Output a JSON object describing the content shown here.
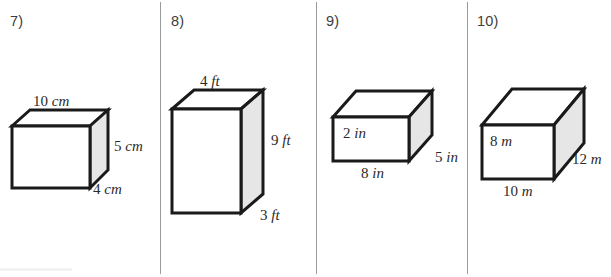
{
  "page": {
    "background_color": "#ffffff",
    "divider_color": "#9a9a9a",
    "ink_color": "#1a1a1a",
    "shade_color": "#e6e6e6"
  },
  "problems": [
    {
      "number": "7)",
      "shape": "rectangular-prism",
      "labels": {
        "top": {
          "value": "10",
          "unit": "cm"
        },
        "right": {
          "value": "5",
          "unit": "cm"
        },
        "depth": {
          "value": "4",
          "unit": "cm"
        }
      }
    },
    {
      "number": "8)",
      "shape": "rectangular-prism",
      "labels": {
        "top": {
          "value": "4",
          "unit": "ft"
        },
        "right": {
          "value": "9",
          "unit": "ft"
        },
        "depth": {
          "value": "3",
          "unit": "ft"
        }
      }
    },
    {
      "number": "9)",
      "shape": "rectangular-prism",
      "labels": {
        "height": {
          "value": "2",
          "unit": "in"
        },
        "width": {
          "value": "8",
          "unit": "in"
        },
        "depth": {
          "value": "5",
          "unit": "in"
        }
      }
    },
    {
      "number": "10)",
      "shape": "rectangular-prism",
      "labels": {
        "height": {
          "value": "8",
          "unit": "m"
        },
        "width": {
          "value": "10",
          "unit": "m"
        },
        "depth": {
          "value": "12",
          "unit": "m"
        }
      }
    }
  ]
}
